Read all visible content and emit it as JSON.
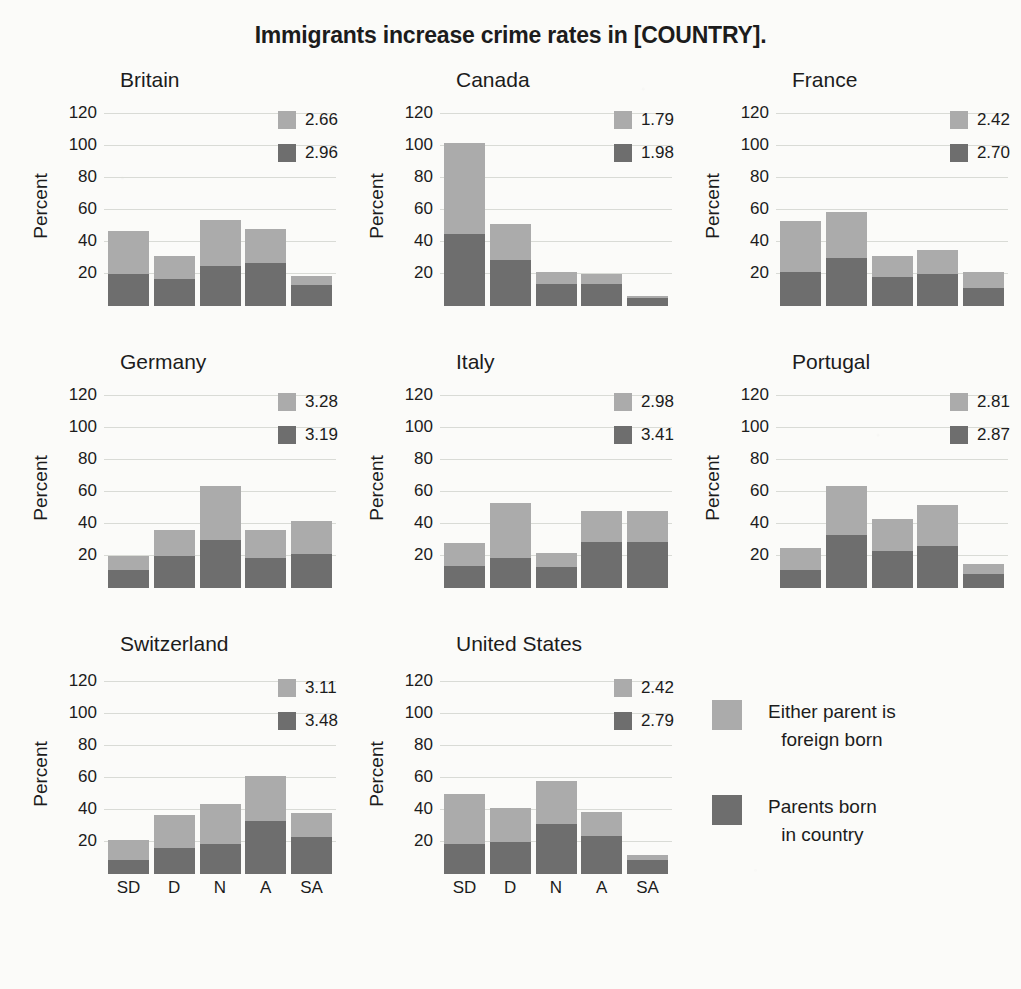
{
  "title": "Immigrants increase crime rates in [COUNTRY].",
  "axis": {
    "ylabel": "Percent",
    "yticks": [
      "120",
      "100",
      "80",
      "60",
      "40",
      "20"
    ],
    "xticks": [
      "SD",
      "D",
      "N",
      "A",
      "SA"
    ]
  },
  "legend": {
    "light_label_line1": "Either parent is",
    "light_label_line2": "foreign born",
    "dark_label_line1": "Parents born",
    "dark_label_line2": "in country"
  },
  "colors": {
    "light": "#ababab",
    "dark": "#6e6e6e",
    "background": "#fbfbf9",
    "gridline": "#d9dbd6",
    "text": "#1c1c1c"
  },
  "panels": [
    {
      "name": "Britain",
      "mean_light": "2.66",
      "mean_dark": "2.96",
      "light": [
        27,
        14,
        29,
        21,
        6
      ],
      "dark": [
        20,
        17,
        25,
        27,
        13
      ],
      "total": [
        47,
        31,
        54,
        48,
        19
      ]
    },
    {
      "name": "Canada",
      "mean_light": "1.79",
      "mean_dark": "1.98",
      "light": [
        57,
        22,
        7,
        6,
        1
      ],
      "dark": [
        45,
        29,
        14,
        14,
        5
      ],
      "total": [
        102,
        51,
        21,
        20,
        6
      ]
    },
    {
      "name": "France",
      "mean_light": "2.42",
      "mean_dark": "2.70",
      "light": [
        32,
        29,
        13,
        15,
        10
      ],
      "dark": [
        21,
        30,
        18,
        20,
        11
      ],
      "total": [
        53,
        59,
        31,
        35,
        21
      ]
    },
    {
      "name": "Germany",
      "mean_light": "3.28",
      "mean_dark": "3.19",
      "light": [
        9,
        16,
        34,
        17,
        21
      ],
      "dark": [
        11,
        20,
        30,
        19,
        21
      ],
      "total": [
        20,
        36,
        64,
        36,
        42
      ]
    },
    {
      "name": "Italy",
      "mean_light": "2.98",
      "mean_dark": "3.41",
      "light": [
        14,
        34,
        9,
        19,
        19
      ],
      "dark": [
        14,
        19,
        13,
        29,
        29
      ],
      "total": [
        28,
        53,
        22,
        48,
        48
      ]
    },
    {
      "name": "Portugal",
      "mean_light": "2.81",
      "mean_dark": "2.87",
      "light": [
        14,
        31,
        20,
        26,
        6
      ],
      "dark": [
        11,
        33,
        23,
        26,
        9
      ],
      "total": [
        25,
        64,
        43,
        52,
        15
      ]
    },
    {
      "name": "Switzerland",
      "mean_light": "3.11",
      "mean_dark": "3.48",
      "light": [
        12,
        21,
        25,
        28,
        15
      ],
      "dark": [
        9,
        16,
        19,
        33,
        23
      ],
      "total": [
        21,
        37,
        44,
        61,
        38
      ]
    },
    {
      "name": "United States",
      "mean_light": "2.42",
      "mean_dark": "2.79",
      "light": [
        31,
        21,
        27,
        15,
        3
      ],
      "dark": [
        19,
        20,
        31,
        24,
        9
      ],
      "total": [
        50,
        41,
        58,
        39,
        12
      ]
    }
  ],
  "chart_data": {
    "type": "bar",
    "title": "Immigrants increase crime rates in [COUNTRY].",
    "subtitle": "",
    "xlabel": "",
    "ylabel": "Percent",
    "ylim": [
      0,
      125
    ],
    "yticks": [
      20,
      40,
      60,
      80,
      100,
      120
    ],
    "grid": true,
    "stacked": true,
    "legend_position": "bottom-right",
    "categories": [
      "SD",
      "D",
      "N",
      "A",
      "SA"
    ],
    "category_full_names": [
      "Strongly disagree",
      "Disagree",
      "Neither",
      "Agree",
      "Strongly agree"
    ],
    "series_names": [
      "Parents born in country",
      "Either parent is foreign born"
    ],
    "facets": [
      {
        "name": "Britain",
        "annotation_light": 2.66,
        "annotation_dark": 2.96,
        "series": [
          {
            "name": "Parents born in country",
            "values": [
              20,
              17,
              25,
              27,
              13
            ]
          },
          {
            "name": "Either parent is foreign born",
            "values": [
              27,
              14,
              29,
              21,
              6
            ]
          }
        ],
        "totals": [
          47,
          31,
          54,
          48,
          19
        ]
      },
      {
        "name": "Canada",
        "annotation_light": 1.79,
        "annotation_dark": 1.98,
        "series": [
          {
            "name": "Parents born in country",
            "values": [
              45,
              29,
              14,
              14,
              5
            ]
          },
          {
            "name": "Either parent is foreign born",
            "values": [
              57,
              22,
              7,
              6,
              1
            ]
          }
        ],
        "totals": [
          102,
          51,
          21,
          20,
          6
        ]
      },
      {
        "name": "France",
        "annotation_light": 2.42,
        "annotation_dark": 2.7,
        "series": [
          {
            "name": "Parents born in country",
            "values": [
              21,
              30,
              18,
              20,
              11
            ]
          },
          {
            "name": "Either parent is foreign born",
            "values": [
              32,
              29,
              13,
              15,
              10
            ]
          }
        ],
        "totals": [
          53,
          59,
          31,
          35,
          21
        ]
      },
      {
        "name": "Germany",
        "annotation_light": 3.28,
        "annotation_dark": 3.19,
        "series": [
          {
            "name": "Parents born in country",
            "values": [
              11,
              20,
              30,
              19,
              21
            ]
          },
          {
            "name": "Either parent is foreign born",
            "values": [
              9,
              16,
              34,
              17,
              21
            ]
          }
        ],
        "totals": [
          20,
          36,
          64,
          36,
          42
        ]
      },
      {
        "name": "Italy",
        "annotation_light": 2.98,
        "annotation_dark": 3.41,
        "series": [
          {
            "name": "Parents born in country",
            "values": [
              14,
              19,
              13,
              29,
              29
            ]
          },
          {
            "name": "Either parent is foreign born",
            "values": [
              14,
              34,
              9,
              19,
              19
            ]
          }
        ],
        "totals": [
          28,
          53,
          22,
          48,
          48
        ]
      },
      {
        "name": "Portugal",
        "annotation_light": 2.81,
        "annotation_dark": 2.87,
        "series": [
          {
            "name": "Parents born in country",
            "values": [
              11,
              33,
              23,
              26,
              9
            ]
          },
          {
            "name": "Either parent is foreign born",
            "values": [
              14,
              31,
              20,
              26,
              6
            ]
          }
        ],
        "totals": [
          25,
          64,
          43,
          52,
          15
        ]
      },
      {
        "name": "Switzerland",
        "annotation_light": 3.11,
        "annotation_dark": 3.48,
        "series": [
          {
            "name": "Parents born in country",
            "values": [
              9,
              16,
              19,
              33,
              23
            ]
          },
          {
            "name": "Either parent is foreign born",
            "values": [
              12,
              21,
              25,
              28,
              15
            ]
          }
        ],
        "totals": [
          21,
          37,
          44,
          61,
          38
        ]
      },
      {
        "name": "United States",
        "annotation_light": 2.42,
        "annotation_dark": 2.79,
        "series": [
          {
            "name": "Parents born in country",
            "values": [
              19,
              20,
              31,
              24,
              9
            ]
          },
          {
            "name": "Either parent is foreign born",
            "values": [
              31,
              21,
              27,
              15,
              3
            ]
          }
        ],
        "totals": [
          50,
          41,
          58,
          39,
          12
        ]
      }
    ]
  }
}
